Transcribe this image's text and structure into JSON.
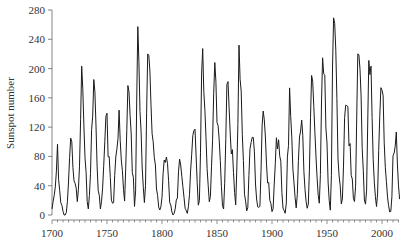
{
  "chart_data": {
    "type": "line",
    "title": "",
    "xlabel": "",
    "ylabel": "Sunspot number",
    "xlim": [
      1700,
      2016
    ],
    "ylim": [
      0,
      280
    ],
    "grid": false,
    "legend": null,
    "x_ticks": [
      1700,
      1750,
      1800,
      1850,
      1900,
      1950,
      2000
    ],
    "x_minor_tick_step": 5,
    "y_ticks": [
      0,
      40,
      80,
      120,
      160,
      200,
      240,
      280
    ],
    "line_color": "#1a1a1a",
    "x_start": 1700,
    "x_step": 1,
    "series": [
      {
        "name": "Sunspot number",
        "values": [
          8.3,
          18.3,
          26.7,
          38.3,
          60.0,
          96.7,
          48.3,
          33.3,
          16.7,
          13.3,
          5.0,
          0.0,
          0.0,
          3.3,
          18.3,
          45.0,
          78.3,
          105.0,
          100.0,
          65.0,
          46.7,
          43.3,
          36.7,
          18.3,
          35.0,
          66.7,
          130.0,
          203.3,
          171.7,
          121.7,
          78.3,
          58.3,
          18.3,
          8.3,
          26.7,
          56.7,
          116.7,
          135.0,
          185.0,
          168.3,
          121.7,
          66.7,
          33.3,
          26.7,
          8.3,
          18.3,
          36.7,
          66.7,
          100.0,
          134.8,
          139.0,
          79.5,
          79.7,
          51.2,
          20.3,
          16.0,
          17.0,
          54.0,
          79.3,
          90.0,
          104.8,
          143.2,
          102.0,
          75.2,
          60.7,
          34.8,
          19.0,
          63.0,
          116.3,
          176.8,
          168.0,
          136.0,
          110.8,
          58.0,
          51.0,
          11.7,
          33.0,
          154.2,
          257.3,
          209.8,
          141.3,
          113.5,
          64.2,
          38.0,
          17.0,
          40.2,
          138.2,
          220.0,
          218.2,
          196.8,
          149.8,
          111.0,
          100.0,
          78.2,
          68.3,
          35.5,
          26.7,
          10.7,
          6.8,
          11.3,
          24.2,
          56.7,
          75.0,
          71.8,
          79.2,
          70.3,
          46.8,
          16.8,
          13.5,
          4.2,
          0.0,
          2.3,
          8.3,
          20.3,
          23.2,
          59.0,
          76.3,
          68.3,
          52.9,
          38.5,
          24.2,
          9.2,
          6.3,
          2.2,
          11.4,
          28.2,
          59.9,
          83.0,
          108.5,
          115.2,
          117.4,
          80.8,
          44.3,
          13.4,
          19.5,
          85.8,
          192.7,
          227.3,
          168.7,
          143.0,
          105.5,
          63.3,
          40.3,
          18.1,
          25.1,
          65.8,
          102.7,
          166.3,
          208.3,
          182.5,
          126.3,
          122.0,
          102.7,
          74.1,
          39.0,
          12.7,
          8.2,
          43.4,
          104.4,
          178.3,
          182.2,
          146.6,
          112.1,
          83.5,
          89.2,
          57.8,
          30.7,
          13.9,
          62.8,
          123.6,
          232.0,
          185.3,
          169.2,
          110.1,
          74.5,
          28.3,
          18.9,
          5.7,
          10.0,
          53.7,
          90.5,
          99.0,
          106.1,
          105.8,
          86.3,
          42.4,
          21.8,
          11.2,
          10.4,
          11.8,
          59.5,
          121.7,
          142.0,
          130.0,
          106.6,
          69.4,
          43.8,
          44.4,
          20.2,
          15.7,
          4.6,
          8.5,
          40.8,
          70.1,
          105.5,
          90.1,
          102.8,
          80.9,
          73.2,
          30.9,
          9.5,
          6.0,
          2.4,
          16.1,
          79.0,
          95.0,
          173.6,
          134.6,
          105.7,
          62.7,
          43.5,
          23.7,
          9.7,
          27.9,
          74.0,
          106.5,
          114.7,
          129.7,
          108.2,
          59.4,
          35.1,
          18.6,
          9.2,
          14.6,
          60.2,
          132.8,
          190.6,
          182.6,
          148.0,
          113.0,
          79.2,
          50.8,
          27.1,
          16.1,
          55.3,
          154.3,
          214.7,
          193.0,
          190.7,
          118.9,
          98.3,
          45.0,
          20.1,
          6.6,
          54.2,
          200.7,
          269.3,
          261.7,
          225.1,
          159.0,
          76.4,
          53.4,
          39.9,
          15.0,
          22.0,
          66.8,
          132.9,
          150.0,
          149.4,
          148.0,
          94.4,
          97.6,
          54.1,
          49.2,
          22.5,
          18.4,
          39.3,
          131.0,
          220.1,
          218.9,
          198.9,
          162.4,
          91.0,
          60.5,
          20.6,
          14.8,
          33.9,
          123.0,
          211.1,
          191.8,
          203.3,
          133.0,
          76.1,
          44.9,
          25.1,
          11.6,
          28.9,
          88.3,
          136.3,
          173.9,
          170.4,
          163.6,
          99.3,
          65.3,
          45.8,
          24.7,
          12.6,
          4.2,
          4.8,
          24.9,
          80.8,
          84.5,
          94.0,
          113.3,
          69.8,
          39.8,
          21.7
        ]
      }
    ]
  }
}
